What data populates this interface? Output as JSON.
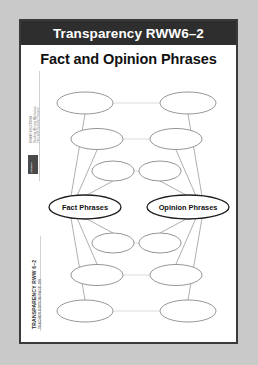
{
  "page": {
    "header_label": "Transparency RWW6–2",
    "title": "Fact and Opinion Phrases"
  },
  "sidebar": {
    "imprint": "GRANT SOLUTIONS",
    "series": "Reading Writing Workshop",
    "lesson": "Fact and Opinion Phrases",
    "logo_text": "LESSON"
  },
  "footer": {
    "title": "TRANSPARENCY RWW 6–2",
    "subtitle": "TEACHER EDITION PAGE 199"
  },
  "diagram": {
    "type": "concept-map",
    "center_nodes": [
      {
        "id": "fact",
        "label": "Fact Phrases",
        "side": "left"
      },
      {
        "id": "opinion",
        "label": "Opinion Phrases",
        "side": "right"
      }
    ],
    "blank_node_count": 12,
    "levels_above": 3,
    "levels_below": 3,
    "blank_nodes": [
      {
        "id": "L-up-3",
        "label": "",
        "side": "left",
        "level": "up-3"
      },
      {
        "id": "R-up-3",
        "label": "",
        "side": "right",
        "level": "up-3"
      },
      {
        "id": "L-up-2",
        "label": "",
        "side": "left",
        "level": "up-2"
      },
      {
        "id": "R-up-2",
        "label": "",
        "side": "right",
        "level": "up-2"
      },
      {
        "id": "L-up-1",
        "label": "",
        "side": "left",
        "level": "up-1"
      },
      {
        "id": "R-up-1",
        "label": "",
        "side": "right",
        "level": "up-1"
      },
      {
        "id": "L-dn-1",
        "label": "",
        "side": "left",
        "level": "down-1"
      },
      {
        "id": "R-dn-1",
        "label": "",
        "side": "right",
        "level": "down-1"
      },
      {
        "id": "L-dn-2",
        "label": "",
        "side": "left",
        "level": "down-2"
      },
      {
        "id": "R-dn-2",
        "label": "",
        "side": "right",
        "level": "down-2"
      },
      {
        "id": "L-dn-3",
        "label": "",
        "side": "left",
        "level": "down-3"
      },
      {
        "id": "R-dn-3",
        "label": "",
        "side": "right",
        "level": "down-3"
      }
    ]
  },
  "colors": {
    "page_background": "#c9c9c9",
    "sheet": "#ffffff",
    "header_bar": "#2e2e2e",
    "border": "#3a3a3a",
    "oval_stroke": "#8a8a8a",
    "main_oval_stroke": "#1d1d1d",
    "connector": "#d8d8d8"
  }
}
